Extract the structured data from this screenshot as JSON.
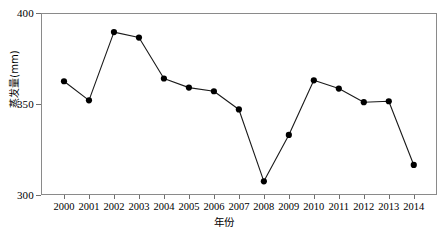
{
  "chart_data": {
    "type": "line",
    "title": "",
    "subtitle": "",
    "xlabel": "年份",
    "ylabel": "蒸发量(mm)",
    "categories": [
      "2000",
      "2001",
      "2002",
      "2003",
      "2004",
      "2005",
      "2006",
      "2007",
      "2008",
      "2009",
      "2010",
      "2011",
      "2012",
      "2013",
      "2014"
    ],
    "values": [
      362.5,
      352.0,
      389.5,
      386.5,
      364.0,
      359.0,
      357.0,
      347.0,
      307.5,
      333.0,
      363.0,
      358.5,
      351.0,
      351.5,
      316.5
    ],
    "series": [
      {
        "name": "蒸发量",
        "values": [
          362.5,
          352.0,
          389.5,
          386.5,
          364.0,
          359.0,
          357.0,
          347.0,
          307.5,
          333.0,
          363.0,
          358.5,
          351.0,
          351.5,
          316.5
        ]
      }
    ],
    "ylim": [
      300,
      400
    ],
    "ytick_labels": [
      "300",
      "350",
      "400"
    ],
    "ytick_values": [
      300,
      350,
      400
    ],
    "xtick_labels": [
      "2000",
      "2001",
      "2002",
      "2003",
      "2004",
      "2005",
      "2006",
      "2007",
      "2008",
      "2009",
      "2010",
      "2011",
      "2012",
      "2013",
      "2014"
    ],
    "grid": false,
    "legend": false,
    "legend_position": "none",
    "marker": "filled-circle",
    "marker_color": "#000000",
    "line_color": "#1a1a1a",
    "frame_color": "#8a8a8a",
    "background_color": "#ffffff"
  },
  "axes": {
    "y": {
      "label": "蒸发量(mm)",
      "ticks": [
        {
          "label": "400",
          "value": 400
        },
        {
          "label": "350",
          "value": 350
        },
        {
          "label": "300",
          "value": 300
        }
      ]
    },
    "x": {
      "label": "年份",
      "ticks": [
        {
          "label": "2000"
        },
        {
          "label": "2001"
        },
        {
          "label": "2002"
        },
        {
          "label": "2003"
        },
        {
          "label": "2004"
        },
        {
          "label": "2005"
        },
        {
          "label": "2006"
        },
        {
          "label": "2007"
        },
        {
          "label": "2008"
        },
        {
          "label": "2009"
        },
        {
          "label": "2010"
        },
        {
          "label": "2011"
        },
        {
          "label": "2012"
        },
        {
          "label": "2013"
        },
        {
          "label": "2014"
        }
      ]
    }
  }
}
